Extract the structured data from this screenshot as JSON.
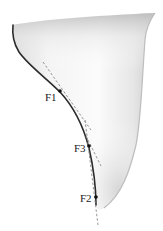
{
  "diagram": {
    "colors": {
      "outline": "#2b2b2b",
      "fill_light": "#fafafa",
      "fill_shade": "#cfcfcf",
      "tangent": "#8a8a8a",
      "point": "#111111",
      "label": "#1a1a1a"
    },
    "points": [
      {
        "id": "F1",
        "label": "F1",
        "x": 60,
        "y": 91,
        "label_x": 45,
        "label_y": 101
      },
      {
        "id": "F3",
        "label": "F3",
        "x": 89,
        "y": 146,
        "label_x": 74,
        "label_y": 152
      },
      {
        "id": "F2",
        "label": "F2",
        "x": 96,
        "y": 197,
        "label_x": 80,
        "label_y": 202
      }
    ],
    "tangent_lines": [
      {
        "name": "tangent-at-F1",
        "x1": 43,
        "y1": 62,
        "x2": 91,
        "y2": 130
      },
      {
        "name": "tangent-at-F3",
        "x1": 86,
        "y1": 136,
        "x2": 101,
        "y2": 166
      },
      {
        "name": "tangent-at-F2",
        "x1": 85,
        "y1": 120,
        "x2": 98,
        "y2": 225
      }
    ]
  }
}
